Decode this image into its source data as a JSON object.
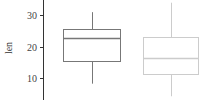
{
  "chart_data": {
    "type": "box",
    "title": "",
    "xlabel": "",
    "ylabel": "len",
    "ylim": [
      0,
      35
    ],
    "yticks": [
      10,
      20,
      30
    ],
    "grid": false,
    "legend": null,
    "series": [
      {
        "name": "group-1",
        "color": "#777777",
        "whisker_low": 8.2,
        "q1": 15.5,
        "median": 22.7,
        "q3": 25.7,
        "whisker_high": 30.9
      },
      {
        "name": "group-2",
        "color": "#cccccc",
        "whisker_low": 4.2,
        "q1": 11.2,
        "median": 16.5,
        "q3": 23.1,
        "whisker_high": 33.9
      }
    ]
  },
  "axis": {
    "ylabel": "len",
    "ticks": [
      {
        "label": "30",
        "y": 15
      },
      {
        "label": "20",
        "y": 46
      },
      {
        "label": "10",
        "y": 78
      }
    ]
  }
}
